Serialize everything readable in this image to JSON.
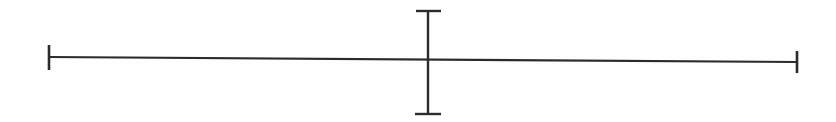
{
  "diagram": {
    "type": "cross-with-tick-marks",
    "stroke_color": "#2b2b2b",
    "background": "#fefefe",
    "horizontal_line": {
      "x1": 49,
      "y1": 57,
      "x2": 797,
      "y2": 62,
      "stroke_width": 2.2
    },
    "left_tick": {
      "x": 49,
      "y1": 45,
      "y2": 70,
      "stroke_width": 2.6
    },
    "right_tick": {
      "x": 797,
      "y1": 51,
      "y2": 73,
      "stroke_width": 2.6
    },
    "vertical_line": {
      "x": 428,
      "y1": 11,
      "y2": 114,
      "stroke_width": 2.4
    },
    "top_cap": {
      "x1": 416,
      "x2": 441,
      "y": 11,
      "stroke_width": 2.4
    },
    "bottom_cap": {
      "x1": 415,
      "x2": 441,
      "y": 114,
      "stroke_width": 2.4
    }
  }
}
